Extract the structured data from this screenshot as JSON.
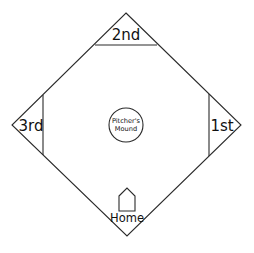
{
  "diagram": {
    "colors": {
      "stroke": "#2a2a2a",
      "text": "#111111",
      "background": "#ffffff"
    },
    "bases": [
      {
        "id": "second",
        "label": "2nd"
      },
      {
        "id": "third",
        "label": "3rd"
      },
      {
        "id": "first",
        "label": "1st"
      }
    ],
    "home": {
      "label": "Home"
    },
    "mound": {
      "line1": "Pitcher's",
      "line2": "Mound"
    }
  }
}
